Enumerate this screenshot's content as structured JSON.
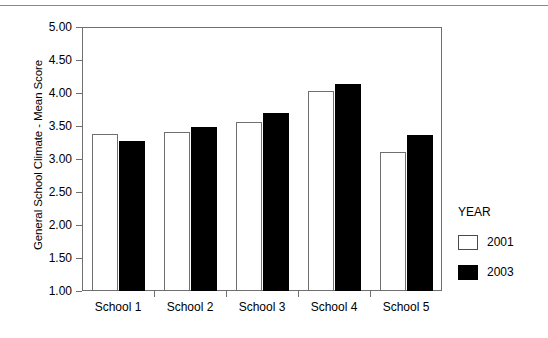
{
  "chart_data": {
    "type": "bar",
    "title": "",
    "xlabel": "",
    "ylabel": "General School Climate - Mean Score",
    "categories": [
      "School 1",
      "School 2",
      "School 3",
      "School 4",
      "School 5"
    ],
    "series": [
      {
        "name": "2001",
        "color": "#ffffff",
        "values": [
          3.38,
          3.41,
          3.56,
          4.03,
          3.11
        ]
      },
      {
        "name": "2003",
        "color": "#000000",
        "values": [
          3.27,
          3.48,
          3.7,
          4.14,
          3.37
        ]
      }
    ],
    "ylim": [
      1.0,
      5.0
    ],
    "ytick_labels": [
      "5.00",
      "4.50",
      "4.00",
      "3.50",
      "3.00",
      "2.50",
      "2.00",
      "1.50",
      "1.00"
    ],
    "ytick_values": [
      5.0,
      4.5,
      4.0,
      3.5,
      3.0,
      2.5,
      2.0,
      1.5,
      1.0
    ],
    "grid": false,
    "legend": {
      "title": "YEAR",
      "position": "right",
      "entries": [
        {
          "label": "2001",
          "swatch": "white-outlined-square"
        },
        {
          "label": "2003",
          "swatch": "black-filled-square"
        }
      ]
    }
  }
}
